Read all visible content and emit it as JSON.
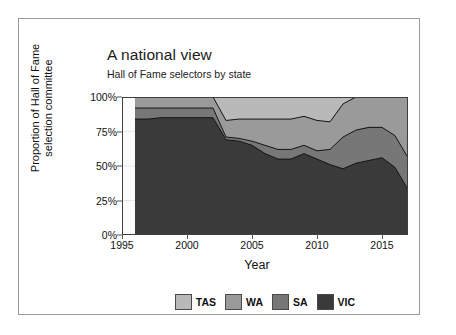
{
  "card": {
    "border_color": "#9a9aa0",
    "background": "#ffffff"
  },
  "chart_data": {
    "type": "area",
    "stacked": true,
    "normalized": true,
    "title": "A national view",
    "subtitle": "Hall of Fame selectors by state",
    "xlabel": "Year",
    "ylabel": "Proportion of Hall of Fame selection committee",
    "ylabel_line1": "Proportion of Hall of Fame",
    "ylabel_line2": "selection committee",
    "grid": true,
    "legend_position": "bottom",
    "xlim": [
      1995,
      2017
    ],
    "ylim": [
      0,
      100
    ],
    "xticks": [
      1995,
      2000,
      2005,
      2010,
      2015
    ],
    "xtick_labels": [
      "1995",
      "2000",
      "2005",
      "2010",
      "2015"
    ],
    "yticks": [
      0,
      25,
      50,
      75,
      100
    ],
    "ytick_labels": [
      "0%",
      "25%",
      "50%",
      "75%",
      "100%"
    ],
    "x": [
      1996,
      1997,
      1998,
      1999,
      2000,
      2001,
      2002,
      2003,
      2004,
      2005,
      2006,
      2007,
      2008,
      2009,
      2010,
      2011,
      2012,
      2013,
      2014,
      2015,
      2016,
      2017
    ],
    "stack_order_bottom_to_top": [
      "VIC",
      "SA",
      "WA",
      "TAS"
    ],
    "series": [
      {
        "name": "TAS",
        "color": "#b9b9b9",
        "values": [
          0,
          0,
          0,
          0,
          0,
          0,
          0,
          17,
          16,
          16,
          16,
          16,
          16,
          14,
          17,
          18,
          5,
          0,
          0,
          0,
          0,
          0
        ]
      },
      {
        "name": "WA",
        "color": "#9a9a9a",
        "values": [
          8,
          8,
          8,
          8,
          8,
          8,
          8,
          12,
          14,
          16,
          19,
          22,
          22,
          21,
          22,
          20,
          24,
          24,
          22,
          22,
          28,
          44
        ]
      },
      {
        "name": "SA",
        "color": "#777777",
        "values": [
          8,
          8,
          7,
          7,
          7,
          7,
          7,
          2,
          2,
          3,
          6,
          7,
          7,
          6,
          6,
          11,
          23,
          24,
          24,
          22,
          23,
          23
        ]
      },
      {
        "name": "VIC",
        "color": "#3a3a3a",
        "values": [
          84,
          84,
          85,
          85,
          85,
          85,
          85,
          69,
          68,
          65,
          59,
          55,
          55,
          59,
          55,
          51,
          48,
          52,
          54,
          56,
          49,
          33
        ]
      }
    ],
    "cumulative_tops": {
      "VIC": [
        84,
        84,
        85,
        85,
        85,
        85,
        85,
        69,
        68,
        65,
        59,
        55,
        55,
        59,
        55,
        51,
        48,
        52,
        54,
        56,
        49,
        33
      ],
      "SA": [
        92,
        92,
        92,
        92,
        92,
        92,
        92,
        71,
        70,
        68,
        65,
        62,
        62,
        65,
        61,
        62,
        71,
        76,
        78,
        78,
        72,
        56
      ],
      "WA": [
        100,
        100,
        100,
        100,
        100,
        100,
        100,
        83,
        84,
        84,
        84,
        84,
        84,
        86,
        83,
        82,
        95,
        100,
        100,
        100,
        100,
        100
      ],
      "TAS": [
        100,
        100,
        100,
        100,
        100,
        100,
        100,
        100,
        100,
        100,
        100,
        100,
        100,
        100,
        100,
        100,
        100,
        100,
        100,
        100,
        100,
        100
      ]
    }
  },
  "legend": {
    "items": [
      {
        "label": "TAS",
        "color": "#b9b9b9"
      },
      {
        "label": "WA",
        "color": "#9a9a9a"
      },
      {
        "label": "SA",
        "color": "#777777"
      },
      {
        "label": "VIC",
        "color": "#3a3a3a"
      }
    ]
  }
}
